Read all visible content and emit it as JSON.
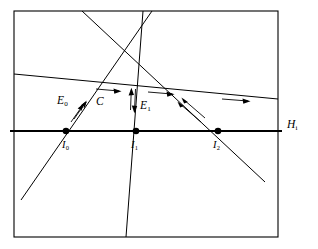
{
  "figure": {
    "background_color": "#ffffff",
    "stroke_color": "#000000",
    "frame": {
      "x": 14,
      "y": 11,
      "width": 264,
      "height": 226,
      "stroke_width": 1.1
    }
  },
  "labels": {
    "E0": {
      "base": "E",
      "sub": "0",
      "x": 57,
      "y": 95
    },
    "C": {
      "base": "C",
      "sub": "",
      "x": 96,
      "y": 96
    },
    "E1": {
      "base": "E",
      "sub": "1",
      "x": 140,
      "y": 100
    },
    "I0": {
      "base": "I",
      "sub": "0",
      "x": 62,
      "y": 140
    },
    "I1": {
      "base": "I",
      "sub": "1",
      "x": 131,
      "y": 140
    },
    "I2": {
      "base": "I",
      "sub": "2",
      "x": 213,
      "y": 140
    },
    "Hi": {
      "base": "H",
      "sub": "i",
      "x": 287,
      "y": 119
    }
  },
  "points": [
    {
      "name": "I0",
      "x": 66,
      "y": 131,
      "r": 3.3
    },
    {
      "name": "I1",
      "x": 136,
      "y": 131,
      "r": 3.3
    },
    {
      "name": "I2",
      "x": 218,
      "y": 131,
      "r": 3.3
    }
  ],
  "lines": {
    "hyperplane": {
      "name": "H_i",
      "x1": 10,
      "y1": 131,
      "x2": 282,
      "y2": 131,
      "stroke_width": 2.2
    },
    "edge_E0": {
      "name": "E_0",
      "x1": 21,
      "y1": 200,
      "x2": 152,
      "y2": 11,
      "stroke_width": 1.0
    },
    "curve_C": {
      "name": "C",
      "x1": 14,
      "y1": 74,
      "x2": 278,
      "y2": 99,
      "stroke_width": 1.0
    },
    "edge_E1": {
      "name": "E_1",
      "x1": 126,
      "y1": 237,
      "x2": 143,
      "y2": 11,
      "stroke_width": 1.0
    },
    "edge_descending": {
      "name": "descending",
      "x1": 82,
      "y1": 11,
      "x2": 265,
      "y2": 182,
      "stroke_width": 1.0
    }
  },
  "arrows": {
    "E0_pair": {
      "direction": "up-right",
      "count": 2,
      "angle_deg": -55
    },
    "C_group": {
      "direction": "right",
      "count": 3,
      "angle_deg": 5
    },
    "E1_up": {
      "direction": "up",
      "count": 1
    },
    "E1_down": {
      "direction": "down",
      "count": 1
    },
    "I2_pair": {
      "direction": "up-left",
      "count": 2,
      "angle_deg": 223
    }
  }
}
